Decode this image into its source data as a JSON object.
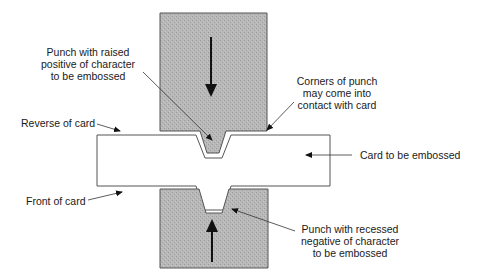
{
  "diagram": {
    "type": "embossing-process-cross-section",
    "colors": {
      "punch_fill": "#b5b5b5",
      "outline": "#555555",
      "text": "#1a1a1a",
      "background": "#ffffff"
    },
    "components": {
      "top_punch": {
        "motion": "down"
      },
      "bottom_punch": {
        "motion": "up"
      },
      "card": {}
    },
    "labels": {
      "top_punch": {
        "line1": "Punch with raised",
        "line2": "positive of character",
        "line3": "to be embossed"
      },
      "corners": {
        "line1": "Corners of punch",
        "line2": "may come into",
        "line3": "contact with card"
      },
      "reverse": "Reverse of card",
      "card": "Card to be embossed",
      "front": "Front of card",
      "bottom_punch": {
        "line1": "Punch with recessed",
        "line2": "negative of character",
        "line3": "to be embossed"
      }
    }
  }
}
